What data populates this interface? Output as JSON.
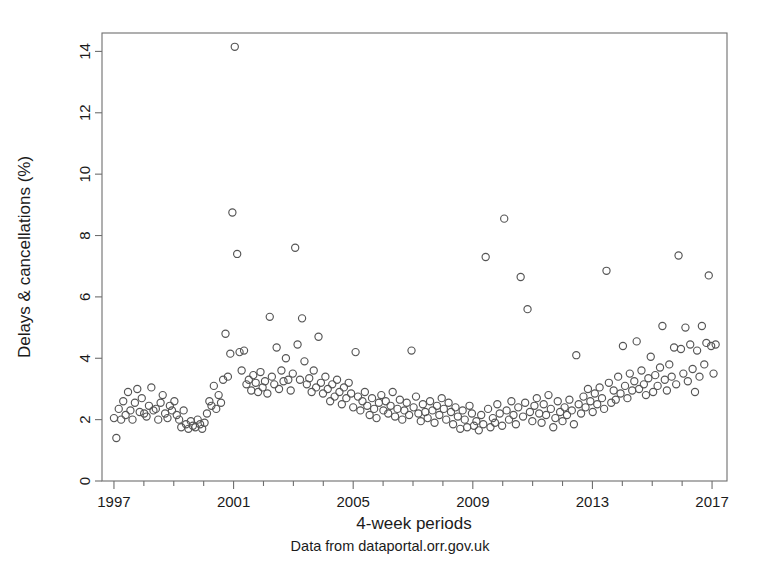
{
  "chart_data": {
    "type": "scatter",
    "title": "",
    "xlabel": "4-week periods",
    "ylabel": "Delays & cancellations (%)",
    "subtitle": "Data from dataportal.orr.gov.uk",
    "xlim": [
      1996.6,
      2017.5
    ],
    "ylim": [
      0,
      14.6
    ],
    "xticks": [
      1997,
      2001,
      2005,
      2009,
      2013,
      2017
    ],
    "xtick_labels": [
      "1997",
      "2001",
      "2005",
      "2009",
      "2013",
      "2017"
    ],
    "xminor_ticks": [
      1998,
      1999,
      2000,
      2002,
      2003,
      2004,
      2006,
      2007,
      2008,
      2010,
      2011,
      2012,
      2014,
      2015,
      2016
    ],
    "yticks": [
      0,
      2,
      4,
      6,
      8,
      10,
      12,
      14
    ],
    "ytick_labels": [
      "0",
      "2",
      "4",
      "6",
      "8",
      "10",
      "12",
      "14"
    ],
    "grid": false,
    "legend": false,
    "marker": "open-circle",
    "marker_color": "#555555",
    "marker_radius": 3.6,
    "series": [
      {
        "name": "Delays & cancellations",
        "x": [
          1997.0,
          1997.08,
          1997.16,
          1997.24,
          1997.31,
          1997.39,
          1997.47,
          1997.55,
          1997.62,
          1997.7,
          1997.78,
          1997.86,
          1997.93,
          1998.01,
          1998.09,
          1998.17,
          1998.25,
          1998.32,
          1998.4,
          1998.48,
          1998.56,
          1998.63,
          1998.71,
          1998.79,
          1998.87,
          1998.94,
          1999.02,
          1999.1,
          1999.18,
          1999.25,
          1999.33,
          1999.41,
          1999.49,
          1999.57,
          1999.64,
          1999.72,
          1999.8,
          1999.88,
          1999.95,
          2000.03,
          2000.11,
          2000.19,
          2000.26,
          2000.34,
          2000.42,
          2000.5,
          2000.58,
          2000.65,
          2000.73,
          2000.81,
          2000.89,
          2000.96,
          2001.04,
          2001.12,
          2001.2,
          2001.27,
          2001.35,
          2001.43,
          2001.51,
          2001.59,
          2001.66,
          2001.74,
          2001.82,
          2001.9,
          2001.97,
          2002.05,
          2002.13,
          2002.21,
          2002.28,
          2002.36,
          2002.44,
          2002.52,
          2002.6,
          2002.67,
          2002.75,
          2002.83,
          2002.91,
          2002.98,
          2003.06,
          2003.14,
          2003.22,
          2003.29,
          2003.37,
          2003.45,
          2003.53,
          2003.61,
          2003.68,
          2003.76,
          2003.84,
          2003.92,
          2003.99,
          2004.07,
          2004.15,
          2004.23,
          2004.3,
          2004.38,
          2004.46,
          2004.54,
          2004.62,
          2004.69,
          2004.77,
          2004.85,
          2004.93,
          2005.0,
          2005.08,
          2005.16,
          2005.24,
          2005.31,
          2005.39,
          2005.47,
          2005.55,
          2005.63,
          2005.7,
          2005.78,
          2005.86,
          2005.94,
          2006.01,
          2006.09,
          2006.17,
          2006.25,
          2006.32,
          2006.4,
          2006.48,
          2006.56,
          2006.64,
          2006.71,
          2006.79,
          2006.87,
          2006.95,
          2007.02,
          2007.1,
          2007.18,
          2007.26,
          2007.33,
          2007.41,
          2007.49,
          2007.57,
          2007.65,
          2007.72,
          2007.8,
          2007.88,
          2007.96,
          2008.03,
          2008.11,
          2008.19,
          2008.27,
          2008.34,
          2008.42,
          2008.5,
          2008.58,
          2008.66,
          2008.73,
          2008.81,
          2008.89,
          2008.97,
          2009.04,
          2009.12,
          2009.2,
          2009.28,
          2009.35,
          2009.43,
          2009.51,
          2009.59,
          2009.67,
          2009.74,
          2009.82,
          2009.9,
          2009.98,
          2010.05,
          2010.13,
          2010.21,
          2010.29,
          2010.36,
          2010.44,
          2010.52,
          2010.6,
          2010.68,
          2010.75,
          2010.83,
          2010.91,
          2010.99,
          2011.06,
          2011.14,
          2011.22,
          2011.3,
          2011.37,
          2011.45,
          2011.53,
          2011.61,
          2011.69,
          2011.76,
          2011.84,
          2011.92,
          2012.0,
          2012.07,
          2012.15,
          2012.23,
          2012.31,
          2012.38,
          2012.46,
          2012.54,
          2012.62,
          2012.7,
          2012.77,
          2012.85,
          2012.93,
          2013.01,
          2013.08,
          2013.16,
          2013.24,
          2013.32,
          2013.39,
          2013.47,
          2013.55,
          2013.63,
          2013.71,
          2013.78,
          2013.86,
          2013.94,
          2014.02,
          2014.09,
          2014.17,
          2014.25,
          2014.33,
          2014.4,
          2014.48,
          2014.56,
          2014.64,
          2014.72,
          2014.79,
          2014.87,
          2014.95,
          2015.03,
          2015.1,
          2015.18,
          2015.26,
          2015.34,
          2015.42,
          2015.49,
          2015.57,
          2015.65,
          2015.73,
          2015.8,
          2015.88,
          2015.96,
          2016.04,
          2016.11,
          2016.19,
          2016.27,
          2016.35,
          2016.43,
          2016.5,
          2016.58,
          2016.66,
          2016.74,
          2016.81,
          2016.89,
          2016.97,
          2017.05,
          2017.12
        ],
        "y": [
          2.05,
          1.4,
          2.35,
          2.0,
          2.6,
          2.15,
          2.9,
          2.3,
          2.0,
          2.55,
          3.0,
          2.25,
          2.7,
          2.2,
          2.1,
          2.45,
          3.05,
          2.3,
          2.35,
          2.0,
          2.55,
          2.8,
          2.2,
          2.05,
          2.45,
          2.3,
          2.6,
          2.15,
          2.0,
          1.75,
          2.3,
          1.85,
          1.7,
          1.95,
          1.8,
          1.75,
          2.0,
          1.85,
          1.7,
          1.9,
          2.2,
          2.6,
          2.45,
          3.1,
          2.35,
          2.8,
          2.55,
          3.3,
          4.8,
          3.4,
          4.15,
          8.75,
          14.15,
          7.4,
          4.2,
          3.6,
          4.25,
          3.15,
          3.3,
          2.95,
          3.45,
          3.2,
          2.9,
          3.55,
          3.05,
          3.25,
          2.85,
          5.35,
          3.4,
          3.15,
          4.35,
          3.0,
          3.6,
          3.25,
          4.0,
          3.3,
          2.95,
          3.5,
          7.6,
          4.45,
          3.3,
          5.3,
          3.9,
          3.15,
          3.35,
          2.9,
          3.6,
          3.05,
          4.7,
          3.2,
          2.85,
          3.4,
          3.0,
          2.6,
          3.15,
          2.75,
          3.3,
          2.9,
          2.5,
          3.05,
          2.7,
          3.2,
          2.85,
          2.4,
          4.2,
          2.75,
          2.3,
          2.6,
          2.9,
          2.45,
          2.15,
          2.7,
          2.35,
          2.05,
          2.55,
          2.8,
          2.3,
          2.6,
          2.2,
          2.45,
          2.9,
          2.1,
          2.35,
          2.65,
          2.0,
          2.3,
          2.55,
          2.15,
          4.25,
          2.4,
          2.75,
          2.2,
          1.95,
          2.5,
          2.25,
          2.05,
          2.6,
          2.3,
          1.9,
          2.45,
          2.15,
          2.7,
          2.35,
          2.0,
          2.55,
          2.25,
          1.85,
          2.4,
          2.1,
          1.7,
          2.3,
          2.0,
          1.75,
          2.45,
          2.2,
          1.8,
          1.95,
          1.65,
          2.15,
          1.85,
          7.3,
          2.35,
          1.75,
          2.05,
          1.9,
          2.5,
          2.2,
          1.8,
          8.55,
          2.3,
          2.0,
          2.6,
          2.15,
          1.85,
          2.4,
          6.65,
          2.1,
          2.55,
          5.6,
          2.25,
          1.95,
          2.45,
          2.7,
          2.2,
          1.9,
          2.5,
          2.15,
          2.8,
          2.35,
          1.75,
          2.05,
          2.6,
          2.25,
          1.95,
          2.4,
          2.15,
          2.65,
          2.3,
          1.85,
          4.1,
          2.5,
          2.2,
          2.75,
          2.4,
          3.0,
          2.6,
          2.25,
          2.85,
          2.5,
          3.05,
          2.7,
          2.35,
          6.85,
          3.2,
          2.55,
          2.95,
          2.65,
          3.4,
          2.85,
          4.4,
          3.1,
          2.7,
          3.5,
          2.95,
          3.25,
          4.55,
          3.0,
          3.6,
          3.15,
          2.8,
          3.35,
          4.05,
          2.9,
          3.45,
          3.1,
          3.7,
          5.05,
          3.3,
          2.95,
          3.8,
          3.4,
          4.35,
          3.15,
          7.35,
          4.3,
          3.5,
          5.0,
          3.25,
          4.45,
          3.65,
          2.9,
          4.25,
          3.4,
          5.05,
          3.8,
          4.5,
          6.7,
          4.4,
          3.5,
          4.45
        ]
      }
    ]
  },
  "figure": {
    "plot_area": {
      "left": 102,
      "top": 33,
      "right": 727,
      "bottom": 481
    }
  }
}
